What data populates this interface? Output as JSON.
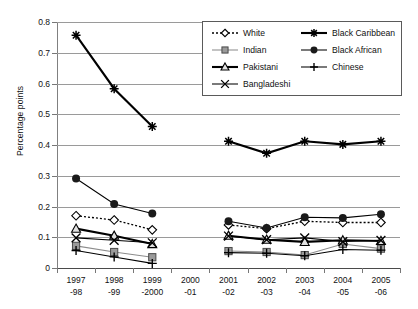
{
  "chart_data": {
    "type": "line",
    "title": "",
    "subtitle": "",
    "xlabel": "",
    "ylabel": "Percentage points",
    "categories": [
      "1997\n-98",
      "1998\n-99",
      "1999\n-2000",
      "2000\n-01",
      "2001\n-02",
      "2002\n-03",
      "2003\n-04",
      "2004\n-05",
      "2005\n-06"
    ],
    "x_tick_labels": [
      {
        "line1": "1997",
        "line2": "-98"
      },
      {
        "line1": "1998",
        "line2": "-99"
      },
      {
        "line1": "1999",
        "line2": "-2000"
      },
      {
        "line1": "2000",
        "line2": "-01"
      },
      {
        "line1": "2001",
        "line2": "-02"
      },
      {
        "line1": "2002",
        "line2": "-03"
      },
      {
        "line1": "2003",
        "line2": "-04"
      },
      {
        "line1": "2004",
        "line2": "-05"
      },
      {
        "line1": "2005",
        "line2": "-06"
      }
    ],
    "ylim": [
      0,
      0.8
    ],
    "y_tick_labels": [
      "0",
      "0.1",
      "0.2",
      "0.3",
      "0.4",
      "0.5",
      "0.6",
      "0.7",
      "0.8"
    ],
    "y_tick_values": [
      0,
      0.1,
      0.2,
      0.3,
      0.4,
      0.5,
      0.6,
      0.7,
      0.8
    ],
    "grid": "horizontal",
    "legend_position": "top-right-inside",
    "note": "Data gap at 2000-01 for every series; Black Caribbean only plotted 1997-1999 and 2001-2005.",
    "series": [
      {
        "name": "White",
        "marker": "diamond-open",
        "line": "dotted",
        "color": "#000000",
        "values": [
          0.17,
          0.156,
          0.124,
          null,
          0.14,
          0.128,
          0.152,
          0.148,
          0.148
        ]
      },
      {
        "name": "Indian",
        "marker": "square-filled",
        "line": "solid",
        "color": "#8c8c8c",
        "values": [
          0.072,
          0.052,
          0.035,
          null,
          0.055,
          0.052,
          0.042,
          0.078,
          0.063
        ]
      },
      {
        "name": "Pakistani",
        "marker": "triangle-open",
        "line": "solid-thick",
        "color": "#000000",
        "values": [
          0.128,
          0.105,
          0.078,
          null,
          0.105,
          0.092,
          0.085,
          0.09,
          0.088
        ]
      },
      {
        "name": "Bangladeshi",
        "marker": "cross-x",
        "line": "solid",
        "color": "#000000",
        "values": [
          0.098,
          0.09,
          0.082,
          null,
          0.104,
          0.092,
          0.098,
          0.086,
          0.09
        ]
      },
      {
        "name": "Black Caribbean",
        "marker": "asterisk",
        "line": "solid-thick",
        "color": "#000000",
        "values": [
          0.757,
          0.583,
          0.46,
          null,
          0.412,
          0.373,
          0.412,
          0.402,
          0.412
        ]
      },
      {
        "name": "Black African",
        "marker": "circle-filled",
        "line": "solid",
        "color": "#000000",
        "values": [
          0.291,
          0.208,
          0.177,
          null,
          0.152,
          0.13,
          0.165,
          0.163,
          0.175
        ]
      },
      {
        "name": "Chinese",
        "marker": "plus",
        "line": "solid",
        "color": "#000000",
        "values": [
          0.057,
          0.036,
          0.015,
          null,
          0.05,
          0.048,
          0.04,
          0.06,
          0.058
        ]
      }
    ]
  },
  "legend": {
    "items": [
      {
        "label": "White"
      },
      {
        "label": "Indian"
      },
      {
        "label": "Pakistani"
      },
      {
        "label": "Bangladeshi"
      },
      {
        "label": "Black Caribbean"
      },
      {
        "label": "Black African"
      },
      {
        "label": "Chinese"
      }
    ]
  }
}
